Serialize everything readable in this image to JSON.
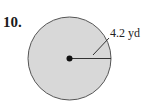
{
  "problem": {
    "number": "10."
  },
  "figure": {
    "shape": "circle",
    "radius_label": "4.2 yd",
    "fill_color": "#d8d8d8",
    "stroke_color": "#555555"
  }
}
